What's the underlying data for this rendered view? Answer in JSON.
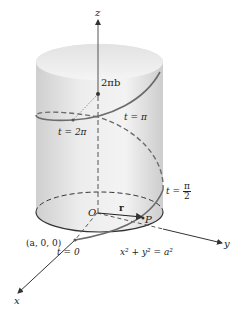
{
  "figure": {
    "axes": {
      "x_label": "x",
      "y_label": "y",
      "z_label": "z"
    },
    "origin_label": "O",
    "vector_label": "r",
    "point_label": "P",
    "start_point_label": "(a, 0, 0)",
    "height_label": "2πb",
    "param_labels": {
      "t0": "t = 0",
      "t_pi_half_prefix": "t =",
      "t_pi_half_num": "π",
      "t_pi_half_den": "2",
      "t_pi": "t = π",
      "t_2pi": "t = 2π"
    },
    "equation": "x² + y² = a²",
    "colors": {
      "helix": "#6b6b6b",
      "axis": "#333333",
      "cylinder_light": "#ececec",
      "cylinder_shade": "#c9c9c9"
    }
  }
}
